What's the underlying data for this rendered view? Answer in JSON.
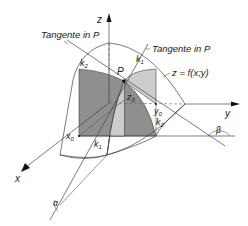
{
  "diagram": {
    "axes": {
      "x_label": "x",
      "y_label": "y",
      "z_label": "z"
    },
    "labels": {
      "tangent_left": "Tangente in P",
      "tangent_right": "Tangente in P",
      "surface": "z = f(x;y)",
      "point": "P",
      "curve_k1_top": "k",
      "curve_k1_top_sub": "1",
      "curve_k2_top": "k",
      "curve_k2_top_sub": "2",
      "curve_k1_bottom": "k",
      "curve_k1_bottom_sub": "1",
      "curve_k2_bottom": "k",
      "curve_k2_bottom_sub": "2",
      "x0": "x",
      "x0_sub": "0",
      "y0": "y",
      "y0_sub": "0",
      "z0": "z",
      "z0_sub": "0",
      "alpha": "α",
      "beta": "β"
    },
    "colors": {
      "dark_fill": "#8c8c8c",
      "light_fill": "#c8c8c8",
      "lines": "#444444",
      "background": "#ffffff"
    }
  }
}
